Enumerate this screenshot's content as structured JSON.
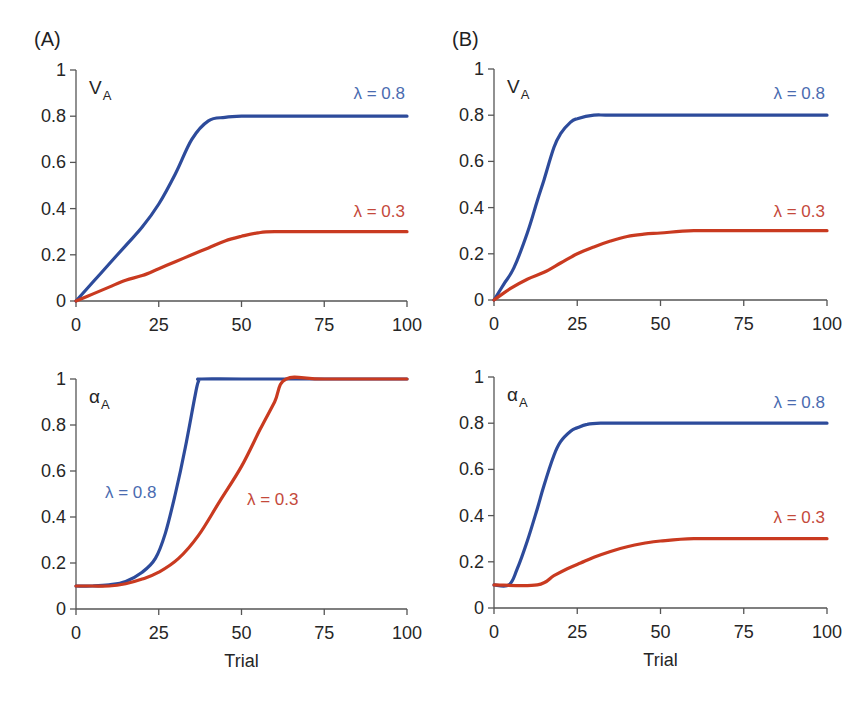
{
  "panels": {
    "A": {
      "label": "(A)"
    },
    "B": {
      "label": "(B)"
    }
  },
  "colors": {
    "lambda_0_8": "#2d4b9b",
    "lambda_0_8_label": "#4a6bb0",
    "lambda_0_3": "#c93a20",
    "lambda_0_3_label": "#c4493b",
    "axis": "#555555"
  },
  "axes": {
    "x_ticks": [
      "0",
      "25",
      "50",
      "75",
      "100"
    ],
    "y_ticks": [
      "0",
      "0.2",
      "0.4",
      "0.6",
      "0.8",
      "1"
    ],
    "x_title": "Trial"
  },
  "labels": {
    "V_main": "V",
    "alpha_main": "α",
    "sub": "A",
    "lambda_08": "λ = 0.8",
    "lambda_03": "λ = 0.3"
  },
  "chart_data": [
    {
      "id": "A-top",
      "type": "line",
      "title": "(A)",
      "ylabel": "V_A",
      "xlabel": "",
      "xlim": [
        0,
        100
      ],
      "ylim": [
        0,
        1
      ],
      "x_ticks": [
        0,
        25,
        50,
        75,
        100
      ],
      "y_ticks": [
        0,
        0.2,
        0.4,
        0.6,
        0.8,
        1
      ],
      "grid": false,
      "series": [
        {
          "name": "λ=0.8",
          "color": "#2d4b9b",
          "x": [
            0,
            5,
            10,
            15,
            20,
            25,
            30,
            35,
            40,
            45,
            50,
            60,
            75,
            100
          ],
          "y": [
            0,
            0.08,
            0.16,
            0.24,
            0.32,
            0.42,
            0.55,
            0.7,
            0.78,
            0.795,
            0.8,
            0.8,
            0.8,
            0.8
          ]
        },
        {
          "name": "λ=0.3",
          "color": "#c93a20",
          "x": [
            0,
            5,
            10,
            15,
            20,
            25,
            30,
            35,
            40,
            45,
            50,
            55,
            60,
            75,
            100
          ],
          "y": [
            0,
            0.03,
            0.06,
            0.09,
            0.11,
            0.14,
            0.17,
            0.2,
            0.23,
            0.26,
            0.28,
            0.295,
            0.3,
            0.3,
            0.3
          ]
        }
      ]
    },
    {
      "id": "B-top",
      "type": "line",
      "title": "(B)",
      "ylabel": "V_A",
      "xlabel": "",
      "xlim": [
        0,
        100
      ],
      "ylim": [
        0,
        1
      ],
      "x_ticks": [
        0,
        25,
        50,
        75,
        100
      ],
      "y_ticks": [
        0,
        0.2,
        0.4,
        0.6,
        0.8,
        1
      ],
      "grid": false,
      "series": [
        {
          "name": "λ=0.8",
          "color": "#2d4b9b",
          "x": [
            0,
            3,
            6,
            10,
            13,
            15,
            18,
            20,
            23,
            25,
            30,
            35,
            50,
            100
          ],
          "y": [
            0,
            0.07,
            0.14,
            0.29,
            0.43,
            0.52,
            0.66,
            0.72,
            0.77,
            0.785,
            0.8,
            0.8,
            0.8,
            0.8
          ]
        },
        {
          "name": "λ=0.3",
          "color": "#c93a20",
          "x": [
            0,
            5,
            10,
            15,
            20,
            25,
            30,
            35,
            40,
            45,
            50,
            60,
            75,
            100
          ],
          "y": [
            0,
            0.05,
            0.09,
            0.12,
            0.16,
            0.2,
            0.23,
            0.255,
            0.275,
            0.285,
            0.29,
            0.3,
            0.3,
            0.3
          ]
        }
      ]
    },
    {
      "id": "A-bottom",
      "type": "line",
      "title": "",
      "ylabel": "α_A",
      "xlabel": "Trial",
      "xlim": [
        0,
        100
      ],
      "ylim": [
        0,
        1
      ],
      "x_ticks": [
        0,
        25,
        50,
        75,
        100
      ],
      "y_ticks": [
        0,
        0.2,
        0.4,
        0.6,
        0.8,
        1
      ],
      "grid": false,
      "series": [
        {
          "name": "λ=0.8",
          "color": "#2d4b9b",
          "x": [
            0,
            5,
            10,
            15,
            20,
            24,
            27,
            30,
            33,
            36,
            37,
            38,
            50,
            75,
            100
          ],
          "y": [
            0.1,
            0.1,
            0.105,
            0.12,
            0.16,
            0.22,
            0.33,
            0.5,
            0.7,
            0.93,
            0.99,
            1.0,
            1.0,
            1.0,
            1.0
          ]
        },
        {
          "name": "λ=0.3",
          "color": "#c93a20",
          "x": [
            0,
            5,
            10,
            15,
            20,
            25,
            31,
            37,
            43.5,
            50,
            55.6,
            60,
            63.5,
            75,
            100
          ],
          "y": [
            0.1,
            0.1,
            0.1,
            0.11,
            0.13,
            0.16,
            0.22,
            0.32,
            0.47,
            0.62,
            0.78,
            0.9,
            1.0,
            1.0,
            1.0
          ]
        }
      ]
    },
    {
      "id": "B-bottom",
      "type": "line",
      "title": "",
      "ylabel": "α_A",
      "xlabel": "Trial",
      "xlim": [
        0,
        100
      ],
      "ylim": [
        0,
        1
      ],
      "x_ticks": [
        0,
        25,
        50,
        75,
        100
      ],
      "y_ticks": [
        0,
        0.2,
        0.4,
        0.6,
        0.8,
        1
      ],
      "grid": false,
      "series": [
        {
          "name": "λ=0.8",
          "color": "#2d4b9b",
          "x": [
            0,
            4.5,
            7,
            10,
            13,
            15,
            18,
            20,
            23,
            25,
            28,
            32,
            40,
            100
          ],
          "y": [
            0.1,
            0.1,
            0.17,
            0.29,
            0.43,
            0.53,
            0.66,
            0.72,
            0.765,
            0.78,
            0.795,
            0.8,
            0.8,
            0.8
          ]
        },
        {
          "name": "λ=0.3",
          "color": "#c93a20",
          "x": [
            0,
            13,
            18,
            22,
            26,
            30,
            35,
            40,
            45,
            50,
            60,
            75,
            100
          ],
          "y": [
            0.1,
            0.1,
            0.14,
            0.17,
            0.195,
            0.22,
            0.245,
            0.265,
            0.28,
            0.29,
            0.3,
            0.3,
            0.3
          ]
        }
      ]
    }
  ]
}
